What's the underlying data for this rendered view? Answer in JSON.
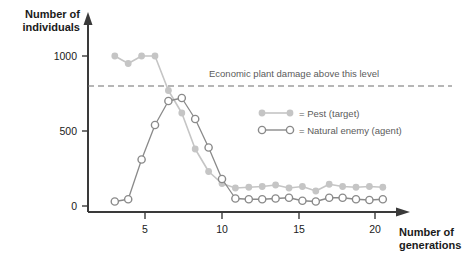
{
  "chart_data": {
    "type": "line",
    "title": "",
    "xlabel": "Number of generations",
    "ylabel": "Number of individuals",
    "xlim": [
      1,
      23
    ],
    "ylim": [
      0,
      1100
    ],
    "xticks": [
      5,
      10,
      15,
      20
    ],
    "yticks": [
      0,
      500,
      1000
    ],
    "grid": false,
    "legend_position": "inside-right",
    "x": [
      2,
      3,
      4,
      5,
      6,
      7,
      8,
      9,
      10,
      11,
      12,
      13,
      14,
      15,
      16,
      17,
      18,
      19,
      20,
      21,
      22
    ],
    "series": [
      {
        "name": "Pest (target)",
        "marker": "filled-circle",
        "color": "#c5c5c5",
        "values": [
          1000,
          950,
          1000,
          1000,
          770,
          620,
          380,
          230,
          150,
          120,
          125,
          130,
          140,
          120,
          130,
          100,
          145,
          130,
          125,
          130,
          125
        ]
      },
      {
        "name": "Natural enemy (agent)",
        "marker": "open-circle",
        "color": "#8a8a8a",
        "values": [
          30,
          45,
          310,
          540,
          700,
          720,
          580,
          390,
          180,
          50,
          45,
          45,
          50,
          55,
          35,
          30,
          55,
          55,
          45,
          40,
          45
        ]
      }
    ],
    "annotations": [
      {
        "type": "hline",
        "value": 800,
        "style": "dashed",
        "label": "Economic plant damage above this level"
      }
    ]
  },
  "axes": {
    "y_title_line1": "Number of",
    "y_title_line2": "individuals",
    "x_title_line1": "Number of",
    "x_title_line2": "generations",
    "y_tick_0": "0",
    "y_tick_500": "500",
    "y_tick_1000": "1000",
    "x_tick_5": "5",
    "x_tick_10": "10",
    "x_tick_15": "15",
    "x_tick_20": "20"
  },
  "annotation": {
    "threshold_label": "Economic plant damage above this level"
  },
  "legend": {
    "pest_label": "= Pest (target)",
    "enemy_label": "= Natural enemy (agent)"
  },
  "colors": {
    "pest": "#c5c5c5",
    "enemy": "#8a8a8a",
    "axis": "#3a3a3a",
    "text": "#1a1a1a",
    "muted_text": "#5b5b5b",
    "dash": "#6e6e6e"
  }
}
